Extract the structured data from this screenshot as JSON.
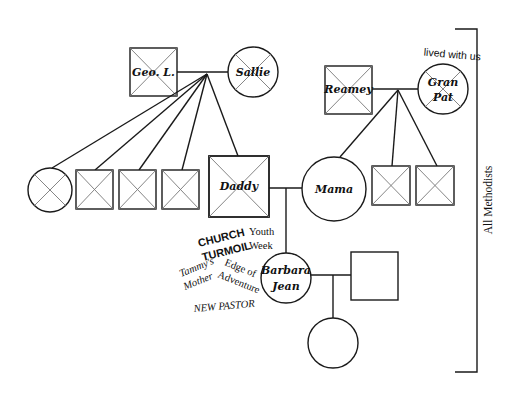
{
  "diagram": {
    "type": "genogram",
    "colors": {
      "line": "#1a1a1a",
      "deceased_mark": "#777777",
      "background": "#ffffff"
    },
    "people": {
      "geo_l": {
        "label": "Geo. L.",
        "sex": "male",
        "deceased": true
      },
      "sallie": {
        "label": "Sallie",
        "sex": "female",
        "deceased": true
      },
      "reamey": {
        "label": "Reamey",
        "sex": "male",
        "deceased": true
      },
      "gran_pat": {
        "label_line1": "Gran",
        "label_line2": "Pat",
        "sex": "female",
        "deceased": true
      },
      "daddy": {
        "label": "Daddy",
        "sex": "male",
        "deceased": true
      },
      "mama": {
        "label": "Mama",
        "sex": "female",
        "deceased": false
      },
      "barbara_jean": {
        "label_line1": "Barbara",
        "label_line2": "Jean",
        "sex": "female",
        "deceased": false
      },
      "spouse": {
        "label": "",
        "sex": "male",
        "deceased": false
      },
      "child": {
        "label": "",
        "sex": "female",
        "deceased": false
      }
    },
    "paternal_siblings": [
      {
        "sex": "female",
        "deceased": true
      },
      {
        "sex": "male",
        "deceased": true
      },
      {
        "sex": "male",
        "deceased": true
      },
      {
        "sex": "male",
        "deceased": true
      }
    ],
    "maternal_siblings": [
      {
        "sex": "male",
        "deceased": true
      },
      {
        "sex": "male",
        "deceased": true
      }
    ],
    "annotations": {
      "lived_with_us": "lived with us",
      "church": "CHURCH",
      "turmoil": "TURMOIL",
      "youth": "Youth",
      "week": "Week",
      "edge_of": "Edge of",
      "adventure": "Adventure",
      "tammys": "Tammy's",
      "mother": "Mother",
      "new_pastor": "NEW PASTOR",
      "all_methodists": "All Methodists"
    }
  }
}
